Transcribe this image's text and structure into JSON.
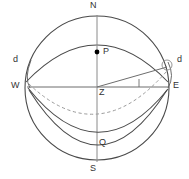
{
  "diagram": {
    "colors": {
      "stroke": "#4a4a4a",
      "stroke_light": "#8a8a8a",
      "dashed": "#9a9a9a",
      "label": "#333333",
      "background": "#ffffff",
      "point_fill": "#000000"
    },
    "labels": [
      {
        "id": "north",
        "text": "N",
        "x": 94,
        "y": 2,
        "anchor": "middle"
      },
      {
        "id": "south",
        "text": "S",
        "x": 94,
        "y": 166,
        "anchor": "middle"
      },
      {
        "id": "west",
        "text": "W",
        "x": 14,
        "y": 82,
        "anchor": "start"
      },
      {
        "id": "east",
        "text": "E",
        "x": 172,
        "y": 82,
        "anchor": "start"
      },
      {
        "id": "zenith-pole",
        "text": "P",
        "x": 104,
        "y": 48,
        "anchor": "start"
      },
      {
        "id": "center",
        "text": "Z",
        "x": 99,
        "y": 90,
        "anchor": "start"
      },
      {
        "id": "nadir-q",
        "text": "Q",
        "x": 99,
        "y": 139,
        "anchor": "start"
      },
      {
        "id": "declination-left",
        "text": "d",
        "x": 14,
        "y": 57,
        "anchor": "start"
      },
      {
        "id": "declination-right",
        "text": "d",
        "x": 176,
        "y": 57,
        "anchor": "start"
      }
    ],
    "points": [
      {
        "id": "pole-point",
        "label": "P",
        "cx": 97,
        "cy": 53,
        "r": 2.4
      },
      {
        "id": "center-point",
        "label": "Z",
        "cx": 97,
        "cy": 87,
        "r": 0
      }
    ],
    "geometry": {
      "sphere": {
        "cx": 97,
        "cy": 88,
        "r": 72
      },
      "horizon_line": {
        "x1": 28,
        "y1": 87,
        "x2": 168,
        "y2": 87
      },
      "meridian_line": {
        "x1": 97,
        "y1": 16,
        "x2": 97,
        "y2": 161
      },
      "sight_line": {
        "x1": 97,
        "y1": 87,
        "x2": 166,
        "y2": 67
      },
      "angle_tick": {
        "x1": 139,
        "y1": 80,
        "x2": 139,
        "y2": 87
      },
      "star_marker": {
        "cx": 166,
        "cy": 66,
        "r": 5
      }
    },
    "curve_names": [
      "celestial-equator-arc",
      "diurnal-circle-dashed",
      "diurnal-circle-solid-upper",
      "diurnal-circle-solid-lower"
    ]
  }
}
